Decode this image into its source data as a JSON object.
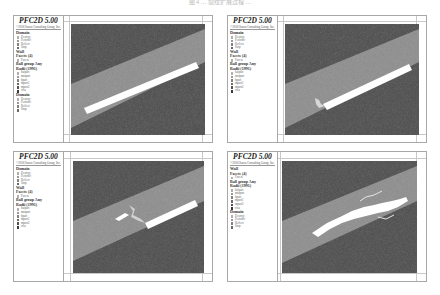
{
  "caption": "图 4 … 裂纹扩展过程 …",
  "colors": {
    "rock_dark": "#4a4a4a",
    "band_light": "#8c8c8c",
    "crack_white": "#ffffff",
    "frame": "#a8a8a8"
  },
  "panels": [
    {
      "id": "a",
      "title": "PFC2D 5.00",
      "copyright": "©2016 Itasca Consulting Group, Inc.",
      "legend": [
        {
          "head": "Domain",
          "items": [
            "Destroy",
            "Periodic",
            "Reflect",
            "Stop"
          ]
        },
        {
          "head": "Wall",
          "items": []
        },
        {
          "head": "Facets (4)",
          "items": [
            "Facets"
          ]
        },
        {
          "head": "Ball group Any",
          "items": []
        },
        {
          "head": "Radii (1991)",
          "items": [
            "halpart",
            "matpart",
            "hpart",
            "mpart1",
            "mpart2",
            "cfsa"
          ]
        },
        {
          "head": "Domain",
          "items": [
            "Destroy",
            "Periodic",
            "Reflect",
            "Stop"
          ]
        }
      ],
      "stage": "initial"
    },
    {
      "id": "b",
      "title": "PFC2D 5.00",
      "copyright": "©2016 Itasca Consulting Group, Inc.",
      "legend": [
        {
          "head": "Domain",
          "items": [
            "Destroy",
            "Periodic",
            "Reflect",
            "Stop"
          ]
        },
        {
          "head": "Wall",
          "items": []
        },
        {
          "head": "Facets (4)",
          "items": [
            "Facets"
          ]
        },
        {
          "head": "Ball group Any",
          "items": []
        },
        {
          "head": "Radii (1991)",
          "items": [
            "halpart",
            "matpart",
            "hpart",
            "mpart1",
            "mpart2",
            "cfsa"
          ]
        }
      ],
      "stage": "crack-initiation"
    },
    {
      "id": "c",
      "title": "PFC2D 5.00",
      "copyright": "©2016 Itasca Consulting Group, Inc.",
      "legend": [
        {
          "head": "Domain",
          "items": [
            "Destroy",
            "Periodic",
            "Reflect",
            "Stop"
          ]
        },
        {
          "head": "Wall",
          "items": []
        },
        {
          "head": "Facets (4)",
          "items": [
            "Facets"
          ]
        },
        {
          "head": "Ball group Any",
          "items": []
        },
        {
          "head": "Radii (1991)",
          "items": [
            "halpart",
            "matpart",
            "hpart",
            "mpart1",
            "mpart2",
            "cfsa"
          ]
        }
      ],
      "stage": "crack-propagation"
    },
    {
      "id": "d",
      "title": "PFC2D 5.00",
      "copyright": "©2016 Itasca Consulting Group, Inc.",
      "legend": [
        {
          "head": "Wall",
          "items": []
        },
        {
          "head": "Facets (4)",
          "items": [
            "Facets"
          ]
        },
        {
          "head": "Ball group Any",
          "items": []
        },
        {
          "head": "Radii (1991)",
          "items": [
            "halpart",
            "matpart",
            "hpart",
            "mpart1",
            "mpart2",
            "cfsa"
          ]
        },
        {
          "head": "Domain",
          "items": [
            "Destroy",
            "Periodic",
            "Reflect",
            "Stop"
          ]
        }
      ],
      "stage": "crack-coalescence"
    }
  ]
}
